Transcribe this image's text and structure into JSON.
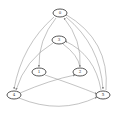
{
  "diagram": {
    "type": "directed-graph",
    "nodes": [
      {
        "id": "n0",
        "label": "0",
        "x": 60,
        "y": 13
      },
      {
        "id": "n3",
        "label": "3",
        "x": 59,
        "y": 40
      },
      {
        "id": "n1",
        "label": "1",
        "x": 39,
        "y": 72
      },
      {
        "id": "n2",
        "label": "2",
        "x": 80,
        "y": 72
      },
      {
        "id": "n4",
        "label": "4",
        "x": 14,
        "y": 95
      },
      {
        "id": "n5",
        "label": "5",
        "x": 103,
        "y": 95
      }
    ],
    "edges": [
      {
        "from": "n0",
        "to": "n4"
      },
      {
        "from": "n0",
        "to": "n1"
      },
      {
        "from": "n0",
        "to": "n5"
      },
      {
        "from": "n2",
        "to": "n0"
      },
      {
        "from": "n3",
        "to": "n4"
      },
      {
        "from": "n3",
        "to": "n2"
      },
      {
        "from": "n5",
        "to": "n3"
      },
      {
        "from": "n1",
        "to": "n5"
      },
      {
        "from": "n4",
        "to": "n2"
      },
      {
        "from": "n4",
        "to": "n5"
      },
      {
        "from": "n5",
        "to": "n0"
      }
    ]
  }
}
